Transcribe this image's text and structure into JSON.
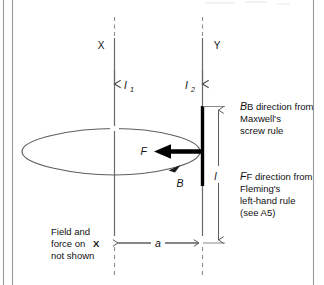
{
  "figure": {
    "labels": {
      "conductor_x": "X",
      "conductor_y": "Y",
      "current_1": "I",
      "current_1_sub": "1",
      "current_2": "I",
      "current_2_sub": "2",
      "force": "F",
      "field": "B",
      "length": "l",
      "separation": "a"
    },
    "annotations": {
      "b_note": [
        "B direction from",
        "Maxwell's",
        "screw rule"
      ],
      "b_note_lead_italic": "B",
      "f_note": [
        "F direction from",
        "Fleming's",
        "left-hand rule",
        "(see A5)"
      ],
      "f_note_lead_italic": "F",
      "footnote": [
        "Field and",
        "force on",
        "not shown"
      ],
      "footnote_bold_token": "X"
    },
    "colors": {
      "background": "#ffffff",
      "ink": "#111111",
      "line": "#555555",
      "dash": "#8d8d8d",
      "thick_conductor": "#000000",
      "border": "#9a9a9a"
    }
  }
}
